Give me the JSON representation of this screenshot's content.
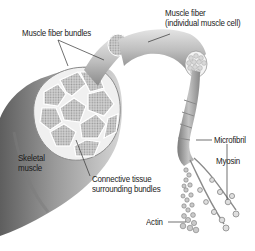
{
  "figure": {
    "labels": {
      "muscle_fiber_bundles": "Muscle fiber bundles",
      "muscle_fiber_line1": "Muscle fiber",
      "muscle_fiber_line2": "(individual muscle cell)",
      "microfibril": "Microfibril",
      "skeletal_line1": "Skeletal",
      "skeletal_line2": "muscle",
      "connective_line1": "Connective tissue",
      "connective_line2": "surrounding bundles",
      "myosin": "Myosin",
      "actin": "Actin"
    },
    "colors": {
      "background": "#ffffff",
      "muscle_dark": "#6e6e6e",
      "muscle_mid": "#a9a9a9",
      "muscle_light": "#d9d9d9",
      "bundle_fill": "#c8c8c8",
      "leader_line": "#333333"
    }
  }
}
